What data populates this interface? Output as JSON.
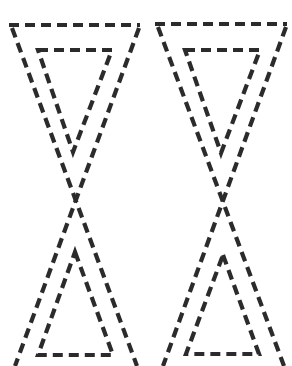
{
  "stroke_color": "#2b2b2b",
  "background": "#ffffff",
  "figures": [
    {
      "name": "left-hourglass",
      "outer": {
        "top": [
          [
            9,
            25
          ],
          [
            140,
            25
          ]
        ],
        "left_leg": [
          [
            12,
            28
          ],
          [
            137,
            366
          ]
        ],
        "right_leg": [
          [
            139,
            28
          ],
          [
            15,
            366
          ]
        ]
      },
      "inner_top_triangle": [
        [
          38,
          50
        ],
        [
          112,
          50
        ],
        [
          73,
          152
        ]
      ],
      "inner_bottom_triangle": [
        [
          75,
          252
        ],
        [
          113,
          355
        ],
        [
          38,
          355
        ]
      ]
    },
    {
      "name": "right-hourglass",
      "outer": {
        "top": [
          [
            155,
            24
          ],
          [
            287,
            24
          ]
        ],
        "left_leg": [
          [
            158,
            27
          ],
          [
            284,
            366
          ]
        ],
        "right_leg": [
          [
            286,
            27
          ],
          [
            163,
            366
          ]
        ]
      },
      "inner_top_triangle": [
        [
          185,
          50
        ],
        [
          260,
          50
        ],
        [
          221,
          153
        ]
      ],
      "inner_bottom_triangle": [
        [
          223,
          255
        ],
        [
          259,
          354
        ],
        [
          186,
          354
        ]
      ]
    }
  ]
}
